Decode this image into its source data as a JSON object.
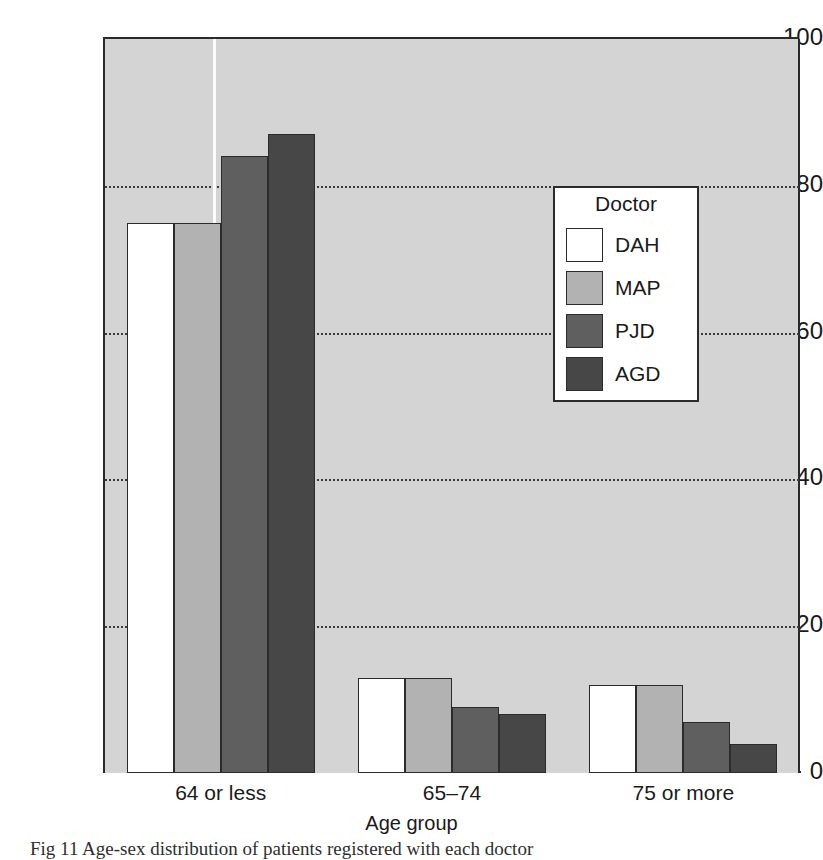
{
  "chart_data": {
    "type": "bar",
    "title": "",
    "xlabel": "Age group",
    "ylabel": "Percentage of patients registered with each doctor",
    "categories": [
      "64 or less",
      "65–74",
      "75 or more"
    ],
    "series": [
      {
        "name": "DAH",
        "values": [
          75,
          13,
          12
        ],
        "color": "#ffffff"
      },
      {
        "name": "MAP",
        "values": [
          75,
          13,
          12
        ],
        "color": "#b2b2b2"
      },
      {
        "name": "PJD",
        "values": [
          84,
          9,
          7
        ],
        "color": "#5f5f5f"
      },
      {
        "name": "AGD",
        "values": [
          87,
          8,
          4
        ],
        "color": "#474747"
      }
    ],
    "ylim": [
      0,
      100
    ],
    "yticks": [
      0,
      20,
      40,
      60,
      80,
      100
    ],
    "ytick_labels": [
      "0",
      "20",
      "40",
      "60",
      "80",
      "100"
    ],
    "grid": "horizontal-dotted",
    "legend_title": "Doctor",
    "legend_position": "upper-right-inside",
    "plot_background": "#d4d4d4",
    "axis_color": "#2b2b2b"
  },
  "caption": {
    "text": "Fig 11 Age-sex distribution of patients registered with each doctor"
  }
}
